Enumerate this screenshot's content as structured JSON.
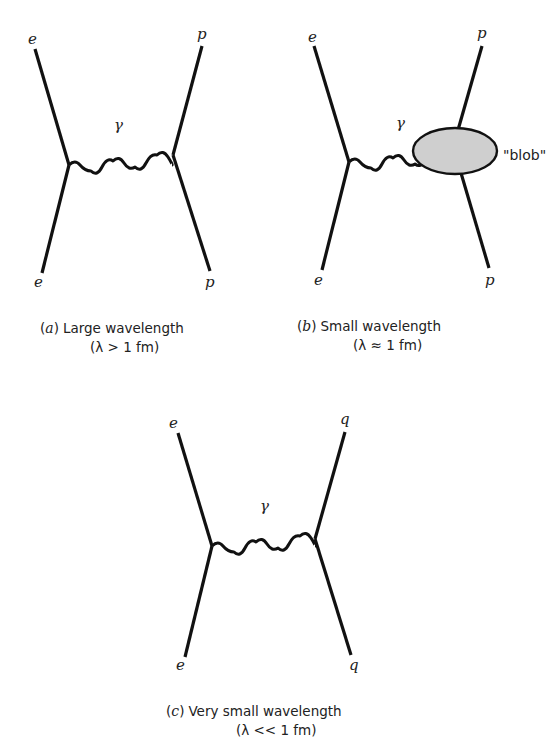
{
  "figure": {
    "panels": [
      {
        "id": "a",
        "labels": {
          "top_left": "e",
          "bottom_left": "e",
          "top_right": "p",
          "bottom_right": "p",
          "boson": "γ"
        },
        "caption": {
          "letter": "a",
          "paren_open": "(",
          "paren_close": ")",
          "title": "Large wavelength",
          "condition": "(λ > 1 fm)"
        }
      },
      {
        "id": "b",
        "labels": {
          "top_left": "e",
          "bottom_left": "e",
          "top_right": "p",
          "bottom_right": "p",
          "boson": "γ",
          "blob": "\"blob\""
        },
        "caption": {
          "letter": "b",
          "paren_open": "(",
          "paren_close": ")",
          "title": "Small wavelength",
          "condition": "(λ ≈ 1 fm)"
        }
      },
      {
        "id": "c",
        "labels": {
          "top_left": "e",
          "bottom_left": "e",
          "top_right": "q",
          "bottom_right": "q",
          "boson": "γ"
        },
        "caption": {
          "letter": "c",
          "paren_open": "(",
          "paren_close": ")",
          "title": "Very small wavelength",
          "condition": "(λ << 1 fm)"
        }
      }
    ],
    "colors": {
      "line": "#111111",
      "blob_fill": "#cfcfcf",
      "background": "#ffffff"
    }
  }
}
